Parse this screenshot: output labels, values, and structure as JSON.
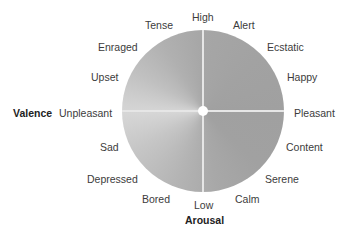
{
  "diagram": {
    "type": "circumplex-model-of-affect",
    "axes": {
      "horizontal": {
        "title": "Valence",
        "left_label": "Unpleasant",
        "right_label": "Pleasant"
      },
      "vertical": {
        "title": "Arousal",
        "top_label": "High",
        "bottom_label": "Low"
      }
    },
    "emotions": {
      "tense": "Tense",
      "alert": "Alert",
      "enraged": "Enraged",
      "ecstatic": "Ecstatic",
      "upset": "Upset",
      "happy": "Happy",
      "sad": "Sad",
      "content": "Content",
      "depressed": "Depressed",
      "serene": "Serene",
      "bored": "Bored",
      "calm": "Calm"
    },
    "colors": {
      "circle_light": "#d6d6d6",
      "circle_dark": "#a0a0a0",
      "axis_lines": "#e6e6e6",
      "text": "#3c3c3c",
      "axis_title": "#222222"
    }
  }
}
